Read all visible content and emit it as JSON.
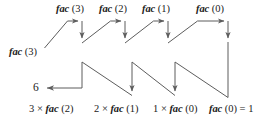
{
  "diagram": {
    "name": "factorial-recursion-trace",
    "stroke_color": "#5d5d5d",
    "text_color": "#1a1a1a",
    "background": "#ffffff",
    "entry": {
      "fn": "fac",
      "arg": "(3)",
      "full": "fac (3)"
    },
    "calls_down": [
      {
        "fn": "fac",
        "arg": "(3)",
        "full": "fac (3)"
      },
      {
        "fn": "fac",
        "arg": "(2)",
        "full": "fac (2)"
      },
      {
        "fn": "fac",
        "arg": "(1)",
        "full": "fac (1)"
      },
      {
        "fn": "fac",
        "arg": "(0)",
        "full": "fac (0)"
      }
    ],
    "returns_up": [
      {
        "prefix": "3 × ",
        "fn": "fac",
        "arg": "(0)",
        "full": "fac (0) = 1",
        "suffix": ""
      },
      {
        "prefix": "2 × ",
        "fn": "fac",
        "arg": "(1)",
        "full": "2 × fac (1)",
        "suffix": ""
      },
      {
        "prefix": "1 × ",
        "fn": "fac",
        "arg": "(0)",
        "full": "1 × fac (0)",
        "suffix": ""
      }
    ],
    "bottom_labels": [
      {
        "num": "3",
        "op": " × ",
        "fn": "fac",
        "arg": " (2)"
      },
      {
        "num": "2",
        "op": " × ",
        "fn": "fac",
        "arg": " (1)"
      },
      {
        "num": "1",
        "op": " × ",
        "fn": "fac",
        "arg": " (0)"
      }
    ],
    "base_case": {
      "fn": "fac",
      "arg": " (0)",
      "equals": " = 1",
      "full": "fac (0) = 1"
    },
    "final_result": "6"
  }
}
